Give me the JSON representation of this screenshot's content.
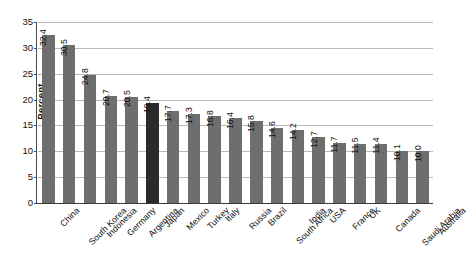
{
  "chart_data": {
    "type": "bar",
    "title": "",
    "xlabel": "",
    "ylabel": "Percent",
    "ylim": [
      0,
      35
    ],
    "ytick_step": 5,
    "yticks": [
      0,
      5,
      10,
      15,
      20,
      25,
      30,
      35
    ],
    "grid": true,
    "legend": "none",
    "orientation": "vertical",
    "value_label_rotation": 90,
    "category_label_rotation": 45,
    "categories": [
      "China",
      "South Korea",
      "Indonesia",
      "Germany",
      "Argentina",
      "Japan",
      "Mexico",
      "Turkey",
      "Italy",
      "Russia",
      "Brazil",
      "South Africa",
      "India",
      "USA",
      "France",
      "UK",
      "Canada",
      "Saudi Arabia",
      "Australia"
    ],
    "values": [
      32.4,
      30.5,
      24.8,
      20.7,
      20.5,
      19.4,
      17.7,
      17.3,
      16.8,
      16.4,
      15.8,
      14.6,
      14.2,
      12.7,
      11.7,
      11.5,
      11.4,
      10.1,
      10.0
    ],
    "value_labels": [
      "32.4",
      "30.5",
      "24.8",
      "20.7",
      "20.5",
      "19.4",
      "17.7",
      "17.3",
      "16.8",
      "16.4",
      "15.8",
      "14.6",
      "14.2",
      "12.7",
      "11.7",
      "11.5",
      "11.4",
      "10.1",
      "10.0"
    ],
    "ytick_labels": [
      "0",
      "5",
      "10",
      "15",
      "20",
      "25",
      "30",
      "35"
    ],
    "highlight_index": 5,
    "colors": {
      "bar": "#6e6e6e",
      "bar_highlight": "#2b2b2b",
      "gridline": "#b9b9b9",
      "axis": "#3a3a3a",
      "text": "#111111",
      "background": "#ffffff"
    }
  }
}
